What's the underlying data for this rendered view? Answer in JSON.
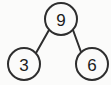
{
  "diagram": {
    "type": "number-bond",
    "background_color": "#fbfbfa",
    "stroke_color": "#2e2e2e",
    "text_color": "#1c1c1c",
    "nodes": {
      "whole": {
        "label": "9",
        "role": "whole",
        "cx": 61,
        "cy": 19,
        "r": 16
      },
      "part_left": {
        "label": "3",
        "role": "part",
        "cx": 24,
        "cy": 64,
        "r": 16
      },
      "part_right": {
        "label": "6",
        "role": "part",
        "cx": 92,
        "cy": 64,
        "r": 16
      }
    },
    "edges": [
      {
        "name": "edge-whole-to-left-part",
        "from": "whole",
        "to": "part_left",
        "x1": 49,
        "y1": 30,
        "x2": 36,
        "y2": 53
      },
      {
        "name": "edge-whole-to-right-part",
        "from": "whole",
        "to": "part_right",
        "x1": 73,
        "y1": 30,
        "x2": 81,
        "y2": 52
      }
    ]
  }
}
